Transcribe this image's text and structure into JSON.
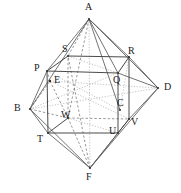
{
  "figure": {
    "stroke_color": "#555555",
    "dashed_color": "#8a8a8a",
    "dotted_color": "#a8a8a8",
    "label_color": "#1a1a1a",
    "background": "#ffffff",
    "width": 181,
    "height": 193
  },
  "octahedron": {
    "name": "outer-octahedron",
    "vertices": [
      {
        "id": "A",
        "label": "A",
        "x": 89,
        "y": 19,
        "label_x": 85,
        "label_y": 3,
        "role": "apex-top"
      },
      {
        "id": "B",
        "label": "B",
        "x": 30,
        "y": 109,
        "label_x": 14,
        "label_y": 103,
        "role": "vertex-left"
      },
      {
        "id": "D",
        "label": "D",
        "x": 158,
        "y": 88,
        "label_x": 164,
        "label_y": 82,
        "role": "vertex-right"
      },
      {
        "id": "F",
        "label": "F",
        "x": 90,
        "y": 168,
        "label_x": 86,
        "label_y": 172,
        "role": "apex-bottom"
      },
      {
        "id": "E",
        "label": "E",
        "x": 50,
        "y": 81,
        "label_x": 55,
        "label_y": 75,
        "role": "vertex-back"
      },
      {
        "id": "C",
        "label": "C",
        "x": 120,
        "y": 110,
        "label_x": 117,
        "label_y": 98,
        "role": "vertex-front"
      }
    ]
  },
  "cube": {
    "name": "inner-cube",
    "vertices": [
      {
        "id": "P",
        "label": "P",
        "x": 47,
        "y": 71,
        "label_x": 36,
        "label_y": 64
      },
      {
        "id": "Q",
        "label": "Q",
        "x": 118,
        "y": 73,
        "label_x": 114,
        "label_y": 76
      },
      {
        "id": "R",
        "label": "R",
        "x": 129,
        "y": 57,
        "label_x": 129,
        "label_y": 47
      },
      {
        "id": "S",
        "label": "S",
        "x": 68,
        "y": 56,
        "label_x": 63,
        "label_y": 45
      },
      {
        "id": "T",
        "label": "T",
        "x": 48,
        "y": 133,
        "label_x": 38,
        "label_y": 134
      },
      {
        "id": "U",
        "label": "U",
        "x": 118,
        "y": 133,
        "label_x": 110,
        "label_y": 126
      },
      {
        "id": "V",
        "label": "V",
        "x": 129,
        "y": 119,
        "label_x": 130,
        "label_y": 119
      },
      {
        "id": "W",
        "label": "W",
        "x": 68,
        "y": 118,
        "label_x": 62,
        "label_y": 110
      }
    ],
    "front_face": [
      "P",
      "Q",
      "U",
      "T"
    ],
    "back_face": [
      "S",
      "R",
      "V",
      "W"
    ],
    "connectors": [
      [
        "P",
        "S"
      ],
      [
        "Q",
        "R"
      ],
      [
        "T",
        "W"
      ],
      [
        "U",
        "V"
      ]
    ]
  },
  "edges": {
    "solid": [
      [
        "P",
        "Q"
      ],
      [
        "Q",
        "U"
      ],
      [
        "U",
        "T"
      ],
      [
        "T",
        "P"
      ],
      [
        "S",
        "R"
      ],
      [
        "R",
        "V"
      ],
      [
        "V",
        "U"
      ],
      [
        "P",
        "S"
      ],
      [
        "Q",
        "R"
      ],
      [
        "T",
        "W"
      ],
      [
        "A",
        "B"
      ],
      [
        "A",
        "D"
      ],
      [
        "A",
        "S"
      ],
      [
        "A",
        "R"
      ],
      [
        "A",
        "P"
      ],
      [
        "A",
        "Q"
      ],
      [
        "B",
        "T"
      ],
      [
        "B",
        "P"
      ],
      [
        "D",
        "R"
      ],
      [
        "D",
        "V"
      ],
      [
        "D",
        "C"
      ],
      [
        "F",
        "T"
      ],
      [
        "F",
        "U"
      ],
      [
        "F",
        "V"
      ],
      [
        "F",
        "B"
      ],
      [
        "F",
        "D"
      ]
    ],
    "dashed": [
      [
        "W",
        "S"
      ],
      [
        "W",
        "V"
      ],
      [
        "E",
        "W"
      ],
      [
        "E",
        "P"
      ],
      [
        "E",
        "T"
      ],
      [
        "B",
        "E"
      ],
      [
        "B",
        "W"
      ],
      [
        "A",
        "E"
      ],
      [
        "F",
        "W"
      ],
      [
        "A",
        "F"
      ]
    ],
    "dotted": [
      [
        "B",
        "C"
      ],
      [
        "E",
        "C"
      ],
      [
        "E",
        "Q"
      ],
      [
        "C",
        "Q"
      ],
      [
        "C",
        "U"
      ],
      [
        "C",
        "R"
      ]
    ]
  },
  "caption": ""
}
